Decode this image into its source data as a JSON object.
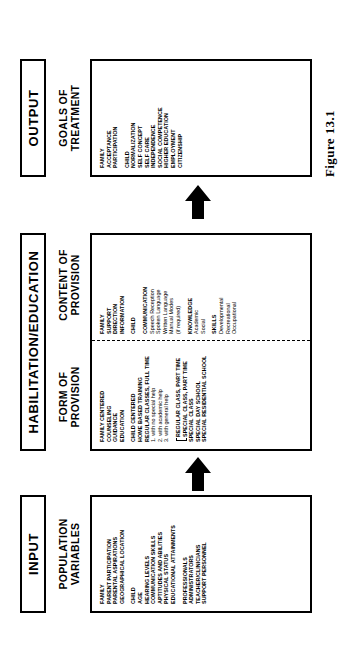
{
  "figure": {
    "caption": "Figure 13.1"
  },
  "stages": {
    "input": {
      "bar_label": "INPUT",
      "sub_heading": "POPULATION\nVARIABLES"
    },
    "habilitation": {
      "bar_label": "HABILITATION/EDUCATION",
      "form_sub_heading": "FORM OF\nPROVISION",
      "content_sub_heading": "CONTENT OF\nPROVISION"
    },
    "output": {
      "bar_label": "OUTPUT",
      "sub_heading": "GOALS OF\nTREATMENT"
    }
  },
  "population_variables": {
    "groups": [
      {
        "heading": "FAMILY",
        "items": [
          {
            "text": "PARENT PARTICIPATION",
            "style": "caps"
          },
          {
            "text": "PARENTAL ASPIRATIONS",
            "style": "caps"
          },
          {
            "text": "GEOGRAPHICAL LOCATION",
            "style": "caps"
          }
        ]
      },
      {
        "heading": "CHILD",
        "items": [
          {
            "text": "AGE",
            "style": "caps"
          },
          {
            "text": "HEARING LEVELS",
            "style": "caps"
          },
          {
            "text": "COMMUNICATION SKILLS",
            "style": "caps"
          },
          {
            "text": "APTITUDES AND ABILITIES",
            "style": "caps"
          },
          {
            "text": "PHYSICAL STATUS",
            "style": "caps"
          },
          {
            "text": "EDUCATIONAL ATTAINMENTS",
            "style": "caps"
          }
        ]
      },
      {
        "heading": "PROFESSIONALS",
        "items": [
          {
            "text": "ADMINISTRATORS",
            "style": "caps"
          },
          {
            "text": "TEACHER/CLINICIANS",
            "style": "caps"
          },
          {
            "text": "SUPPORT PERSONNEL",
            "style": "caps"
          }
        ]
      }
    ]
  },
  "form_of_provision": {
    "groups": [
      {
        "heading": "FAMILY CENTERED",
        "items": [
          {
            "text": "COUNSELING",
            "style": "caps"
          },
          {
            "text": "GUIDANCE",
            "style": "caps"
          },
          {
            "text": "EDUCATION",
            "style": "caps"
          }
        ]
      },
      {
        "heading": "CHILD CENTERED",
        "items": [
          {
            "text": "HOME BASED TRAINING",
            "style": "caps"
          },
          {
            "text": "REGULAR CLASSES, FULL TIME",
            "style": "caps"
          },
          {
            "text": "1. with no special help",
            "style": "plain"
          },
          {
            "text": "2. with academic help",
            "style": "plain"
          },
          {
            "text": "3. with general help",
            "style": "plain"
          }
        ]
      }
    ],
    "bracketed_items": [
      {
        "text": "REGULAR CLASS, PART TIME",
        "style": "caps"
      },
      {
        "text": "SPECIAL CLASS, PART TIME",
        "style": "caps"
      }
    ],
    "trailing_items": [
      {
        "text": "SPECIAL CLASS",
        "style": "caps"
      },
      {
        "text": "SPECIAL DAY SCHOOL",
        "style": "caps"
      },
      {
        "text": "SPECIAL RESIDENTIAL SCHOOL",
        "style": "caps"
      }
    ]
  },
  "content_of_provision": {
    "groups": [
      {
        "heading": "FAMILY",
        "items": [
          {
            "text": "SUPPORT",
            "style": "caps"
          },
          {
            "text": "DIRECTION",
            "style": "caps"
          },
          {
            "text": "INFORMATION",
            "style": "caps"
          }
        ]
      },
      {
        "heading": "CHILD",
        "items": []
      },
      {
        "heading": "COMMUNICATION",
        "items": [
          {
            "text": "Speech Reception",
            "style": "plain"
          },
          {
            "text": "Spoken Language",
            "style": "plain"
          },
          {
            "text": "Written Language",
            "style": "plain"
          },
          {
            "text": "Manual Modes",
            "style": "plain"
          },
          {
            "text": "(if required)",
            "style": "plain"
          }
        ]
      },
      {
        "heading": "KNOWLEDGE",
        "items": [
          {
            "text": "Academic",
            "style": "plain"
          },
          {
            "text": "Social",
            "style": "plain"
          }
        ]
      },
      {
        "heading": "SKILLS",
        "items": [
          {
            "text": "Developmental",
            "style": "plain"
          },
          {
            "text": "Recreational",
            "style": "plain"
          },
          {
            "text": "Occupational",
            "style": "plain"
          }
        ]
      }
    ]
  },
  "goals_of_treatment": {
    "groups": [
      {
        "heading": "FAMILY",
        "items": [
          {
            "text": "ACCEPTANCE",
            "style": "caps"
          },
          {
            "text": "PARTICIPATION",
            "style": "caps"
          }
        ]
      },
      {
        "heading": "CHILD",
        "items": [
          {
            "text": "NORMALIZATION",
            "style": "caps"
          },
          {
            "text": "SELF CONCEPT",
            "style": "caps"
          },
          {
            "text": "SELF CARE",
            "style": "caps"
          },
          {
            "text": "INDEPENDENCE",
            "style": "caps"
          },
          {
            "text": "SOCIAL COMPETENCE",
            "style": "caps"
          },
          {
            "text": "HIGHER EDUCATION",
            "style": "caps"
          },
          {
            "text": "EMPLOYMENT",
            "style": "caps"
          },
          {
            "text": "CITIZENSHIP",
            "style": "caps"
          }
        ]
      }
    ]
  },
  "flow": {
    "arrow_1_name": "arrow-input-to-habilitation",
    "arrow_2_name": "arrow-habilitation-to-output"
  },
  "colors": {
    "ink": "#000000",
    "paper": "#ffffff"
  }
}
